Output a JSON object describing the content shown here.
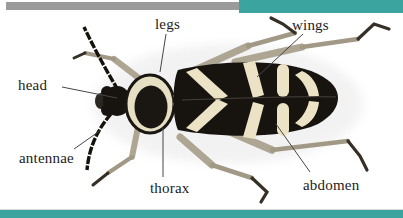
{
  "window": {
    "background": "#ffffff"
  },
  "decor": {
    "top_bar_color": "#9b9b9b",
    "accent_color": "#3ba49e"
  },
  "figure": {
    "illustration_colors": {
      "body": "#17130f",
      "markings": "#ece3c6",
      "legs": "#b0a795",
      "leader_line": "#474747"
    },
    "labels": [
      {
        "id": "legs",
        "text": "legs"
      },
      {
        "id": "wings",
        "text": "wings"
      },
      {
        "id": "head",
        "text": "head"
      },
      {
        "id": "antennae",
        "text": "antennae"
      },
      {
        "id": "thorax",
        "text": "thorax"
      },
      {
        "id": "abdomen",
        "text": "abdomen"
      }
    ]
  }
}
